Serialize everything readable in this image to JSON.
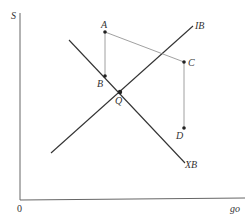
{
  "diagram": {
    "axes": {
      "y_label": "S",
      "x_label": "go",
      "origin_label": "0"
    },
    "lines": {
      "ib_label": "IB",
      "xb_label": "XB"
    },
    "points": {
      "A": "A",
      "B": "B",
      "C": "C",
      "D": "D",
      "Q": "Q"
    },
    "colors": {
      "line": "#333333",
      "thin_line": "#777777",
      "background": "#ffffff"
    }
  }
}
